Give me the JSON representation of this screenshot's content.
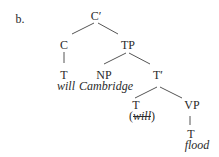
{
  "example_label": "b.",
  "tree": {
    "root": "C′",
    "c": "C",
    "c_child": "T",
    "c_word": "will",
    "tp": "TP",
    "np": "NP",
    "np_word": "Cambridge",
    "tbar": "T′",
    "t2": "T",
    "t2_word_open": "(",
    "t2_word": "will",
    "t2_word_close": ")",
    "vp": "VP",
    "vp_child": "T",
    "vp_word": "flood"
  },
  "colors": {
    "text": "#2a2a2a",
    "lines": "#555555",
    "background": "#ffffff"
  }
}
